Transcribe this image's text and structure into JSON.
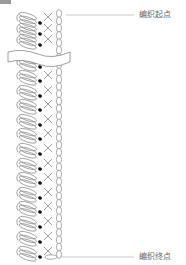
{
  "diagram": {
    "title": "",
    "labels": {
      "start": "编织起点",
      "end": "编织终点"
    },
    "colors": {
      "stroke": "#888888",
      "dot": "#111111",
      "leader_line": "#bbbbbb",
      "label_text": "#666666",
      "logo": "#9a9a9a"
    },
    "rows_before_break": 3,
    "rows_after_break": 14,
    "row_y_before": [
      24,
      35,
      46
    ],
    "row_y_after": [
      68,
      82,
      97,
      111,
      126,
      140,
      155,
      170,
      184,
      199,
      213,
      228,
      243,
      258
    ],
    "symbols": [
      "loop-cluster",
      "slip-stitch-dot",
      "single-crochet-x",
      "chain-link"
    ],
    "break_band_y": 58
  }
}
